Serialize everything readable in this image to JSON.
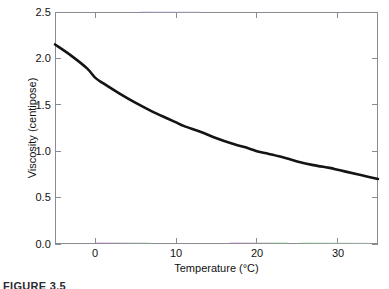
{
  "figure": {
    "caption": "FIGURE 3.5",
    "background_color": "#ffffff",
    "frame_color": "#8a8a92",
    "curve_color": "#141414"
  },
  "chart_data": {
    "type": "line",
    "title": "",
    "subtitle": "",
    "xlabel": "Temperature (°C)",
    "ylabel": "Viscosity (centipose)",
    "xlim": [
      -5,
      35
    ],
    "ylim": [
      0.0,
      2.5
    ],
    "xticks": [
      0,
      10,
      20,
      30
    ],
    "xtick_labels": [
      "0",
      "10",
      "20",
      "30"
    ],
    "yticks": [
      0.0,
      0.5,
      1.0,
      1.5,
      2.0,
      2.5
    ],
    "ytick_labels": [
      "0.0",
      "0.5",
      "1.0",
      "1.5",
      "2.0",
      "2.5"
    ],
    "grid": false,
    "legend": null,
    "legend_position": "none",
    "annotations": [],
    "series": [
      {
        "name": "Viscosity",
        "color": "#141414",
        "line_width": 2.6,
        "x": [
          -5,
          -3,
          -1,
          0,
          1,
          3,
          5,
          7,
          9,
          10,
          11,
          13,
          15,
          17,
          19,
          20,
          21,
          23,
          25,
          27,
          29,
          30,
          31,
          33,
          35
        ],
        "y": [
          2.15,
          2.03,
          1.89,
          1.79,
          1.73,
          1.62,
          1.52,
          1.43,
          1.35,
          1.31,
          1.27,
          1.21,
          1.14,
          1.08,
          1.03,
          1.0,
          0.98,
          0.94,
          0.89,
          0.85,
          0.82,
          0.8,
          0.78,
          0.74,
          0.7
        ]
      }
    ]
  }
}
